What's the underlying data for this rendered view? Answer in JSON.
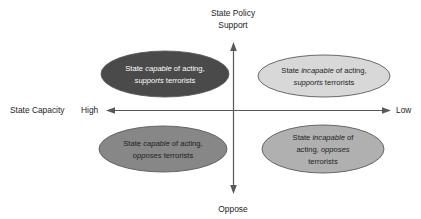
{
  "diagram": {
    "title_top_line1": "State Policy",
    "title_top_line2": "Support",
    "bottom_label": "Oppose",
    "left_axis_name": "State Capacity",
    "left_axis_end_label": "High",
    "right_axis_end_label": "Low",
    "colors": {
      "axis": "#58585a",
      "text_dark": "#1d1d1d",
      "text_light": "#ffffff",
      "outline": "#5a5a5a",
      "quadrant_top_left_fill": "#4a4a4a",
      "quadrant_top_right_fill": "#d8d8d8",
      "quadrant_bottom_left_fill": "#878787",
      "quadrant_bottom_right_fill": "#b0b0b0"
    },
    "quadrants": [
      {
        "id": "top-left",
        "fill": "#4a4a4a",
        "text_color": "#ffffff",
        "lines": [
          [
            {
              "t": "State ",
              "i": false
            },
            {
              "t": "capable",
              "i": true
            },
            {
              "t": " of acting,",
              "i": false
            }
          ],
          [
            {
              "t": "supports",
              "i": true
            },
            {
              "t": " terrorists",
              "i": false
            }
          ]
        ]
      },
      {
        "id": "top-right",
        "fill": "#d8d8d8",
        "text_color": "#1d1d1d",
        "lines": [
          [
            {
              "t": "State ",
              "i": false
            },
            {
              "t": "incapable",
              "i": true
            },
            {
              "t": " of acting,",
              "i": false
            }
          ],
          [
            {
              "t": "supports",
              "i": true
            },
            {
              "t": " terrorists",
              "i": false
            }
          ]
        ]
      },
      {
        "id": "bottom-left",
        "fill": "#878787",
        "text_color": "#1d1d1d",
        "lines": [
          [
            {
              "t": "State ",
              "i": false
            },
            {
              "t": "capable",
              "i": true
            },
            {
              "t": " of acting,",
              "i": false
            }
          ],
          [
            {
              "t": "opposes",
              "i": true
            },
            {
              "t": " terrorists",
              "i": false
            }
          ]
        ]
      },
      {
        "id": "bottom-right",
        "fill": "#b0b0b0",
        "text_color": "#1d1d1d",
        "lines": [
          [
            {
              "t": "State ",
              "i": false
            },
            {
              "t": "incapable",
              "i": true
            },
            {
              "t": " of",
              "i": false
            }
          ],
          [
            {
              "t": "acting, ",
              "i": false
            },
            {
              "t": "opposes",
              "i": true
            }
          ],
          [
            {
              "t": "terrorists",
              "i": false
            }
          ]
        ]
      }
    ]
  }
}
